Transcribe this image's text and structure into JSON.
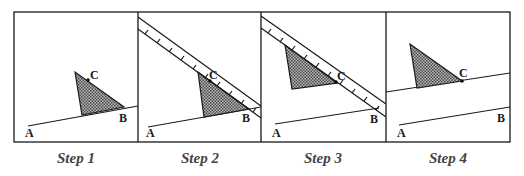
{
  "figure": {
    "type": "geometric-construction",
    "colors": {
      "stroke": "#1a1a1a",
      "fill_pattern_dark": "#555555",
      "fill_pattern_light": "#bbbbbb",
      "label": "#444444"
    },
    "panels": [
      {
        "step_label": "Step 1",
        "point_labels": {
          "A": "A",
          "B": "B",
          "C": "C"
        }
      },
      {
        "step_label": "Step 2",
        "point_labels": {
          "A": "A",
          "B": "B",
          "C": "C"
        }
      },
      {
        "step_label": "Step 3",
        "point_labels": {
          "A": "A",
          "B": "B",
          "C": "C"
        }
      },
      {
        "step_label": "Step 4",
        "point_labels": {
          "A": "A",
          "B": "B",
          "C": "C"
        }
      }
    ]
  }
}
